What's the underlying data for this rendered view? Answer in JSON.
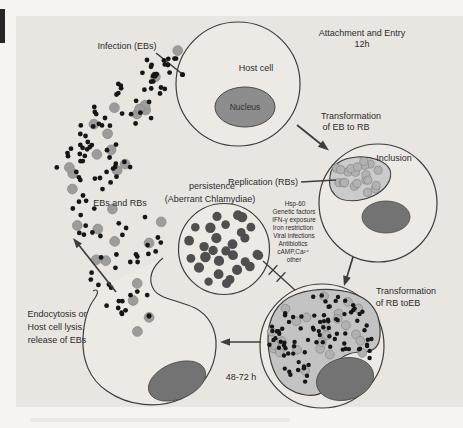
{
  "figure": {
    "labels": {
      "infection": "Infection (EBs)",
      "attachment_1": "Attachment and Entry",
      "attachment_2": "12h",
      "host_cell": "Host cell",
      "nucleus": "Nucleus",
      "transform_eb_rb_1": "Transformation",
      "transform_eb_rb_2": "of EB to RB",
      "inclusion": "Inclusion",
      "replication": "Replication (RBs)",
      "persistence_1": "persistence",
      "persistence_2": "(Aberrant Chlamydiae)",
      "ebs_and_rbs": "EBs and RBs",
      "endocytosis_1": "Endocytosis or",
      "endocytosis_2": "Host cell lysis,",
      "endocytosis_3": "release of EBs",
      "transform_rb_eb_1": "Transformation",
      "transform_rb_eb_2": "of RB toEB",
      "duration": "48-72 h"
    },
    "persistence_factors": [
      "Hsp-60",
      "Genetic factors",
      "IFN-γ exposure",
      "Iron restriction",
      "Viral infections",
      "Antibiotics",
      "cAMP,Ca²⁺",
      "other"
    ]
  },
  "colors": {
    "page": "#f6f4f1",
    "panel": "#e9e6e2",
    "cell_fill": "#edeae6",
    "outline": "#3d3d3d",
    "nucleus_host": "#8d8d8d",
    "nucleus_dark": "#737373",
    "nucleus_stroke": "#4a4a4a",
    "nucleus_text": "#2f2f2f",
    "black_dot": "#161616",
    "gray_dot": "#9c9c9c",
    "gray_dot_stroke": "#868686",
    "persistence_dot": "#4f4f4f",
    "inclusion_blob": "#cbcbcb",
    "rb_circle": "#b2b2b2",
    "rb_stroke": "#858585",
    "bottom_blob": "#c3c3c3",
    "text": "#2b2b2b",
    "smudge": "#262626",
    "caption_streak": "#d9d6d1"
  },
  "dots": {
    "seed": 1337,
    "band_clusters": [
      {
        "cx": 170,
        "cy": 70,
        "r": 26,
        "black": 15,
        "gray": 2
      },
      {
        "cx": 138,
        "cy": 98,
        "r": 28,
        "black": 17,
        "gray": 4
      },
      {
        "cx": 103,
        "cy": 132,
        "r": 28,
        "black": 17,
        "gray": 4
      },
      {
        "cx": 78,
        "cy": 168,
        "r": 26,
        "black": 15,
        "gray": 4
      },
      {
        "cx": 118,
        "cy": 168,
        "r": 20,
        "black": 9,
        "gray": 2
      },
      {
        "cx": 96,
        "cy": 214,
        "r": 26,
        "black": 12,
        "gray": 3
      },
      {
        "cx": 140,
        "cy": 240,
        "r": 28,
        "black": 13,
        "gray": 3
      },
      {
        "cx": 118,
        "cy": 278,
        "r": 30,
        "black": 13,
        "gray": 4
      },
      {
        "cx": 135,
        "cy": 312,
        "r": 22,
        "black": 7,
        "gray": 2
      },
      {
        "cx": 186,
        "cy": 62,
        "r": 13,
        "black": 5,
        "gray": 0
      }
    ],
    "black_dot_r": 2.4,
    "gray_dot_r": 4.9,
    "label_clear_rects": [
      [
        88,
        193,
        64,
        15
      ],
      [
        20,
        306,
        72,
        42
      ],
      [
        160,
        191,
        100,
        14
      ]
    ],
    "avoid_circles": [
      [
        238,
        84,
        66
      ],
      [
        224,
        249,
        49
      ]
    ],
    "persistence": {
      "cx": 224,
      "cy": 249,
      "rings": [
        {
          "r": 0,
          "n": 1
        },
        {
          "r": 12,
          "n": 5
        },
        {
          "r": 23,
          "n": 9
        },
        {
          "r": 34,
          "n": 14
        }
      ],
      "dot_r_min": 4.2,
      "dot_r_var": 1.1
    },
    "inclusion_rbs": {
      "cx": 359,
      "cy": 177,
      "rx": 26,
      "ry": 17,
      "n": 22,
      "dot_r": 4.1
    },
    "bottom_cell": {
      "cx": 322,
      "cy": 340,
      "rx": 53,
      "ry": 46,
      "black": 88,
      "gray": 24,
      "black_r": 2.2,
      "gray_r": 4.4,
      "exclude": {
        "cx": 345,
        "cy": 379,
        "rx": 36,
        "ry": 27
      }
    }
  }
}
